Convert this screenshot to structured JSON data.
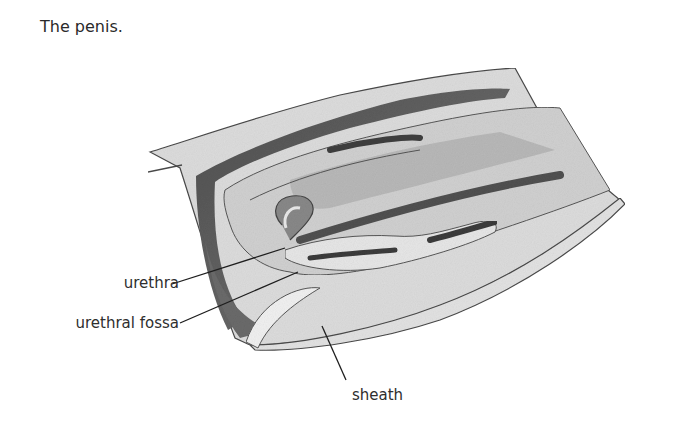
{
  "figure": {
    "title": "The penis.",
    "labels": [
      {
        "id": "urethra",
        "text": "urethra"
      },
      {
        "id": "urethral-fossa",
        "text": "urethral fossa"
      },
      {
        "id": "sheath",
        "text": "sheath"
      }
    ]
  },
  "colors": {
    "outline": "#4a4a4a",
    "dark_tissue": "#5c5c5c",
    "mid_tissue": "#9a9a9a",
    "light_tissue": "#d6d6d6",
    "pale_tissue": "#e8e8e8",
    "leader_line": "#1e1e1e"
  }
}
